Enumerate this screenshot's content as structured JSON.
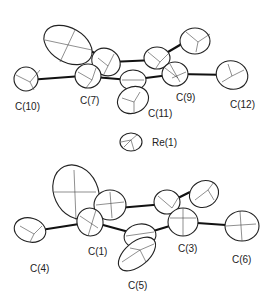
{
  "figure": {
    "type": "ORTEP molecular structure",
    "top_ring_labels": {
      "c10": "C(10)",
      "c7": "C(7)",
      "c9": "C(9)",
      "c11": "C(11)",
      "c12": "C(12)"
    },
    "metal_label": "Re(1)",
    "bottom_ring_labels": {
      "c4": "C(4)",
      "c1": "C(1)",
      "c3": "C(3)",
      "c5": "C(5)",
      "c6": "C(6)"
    }
  }
}
